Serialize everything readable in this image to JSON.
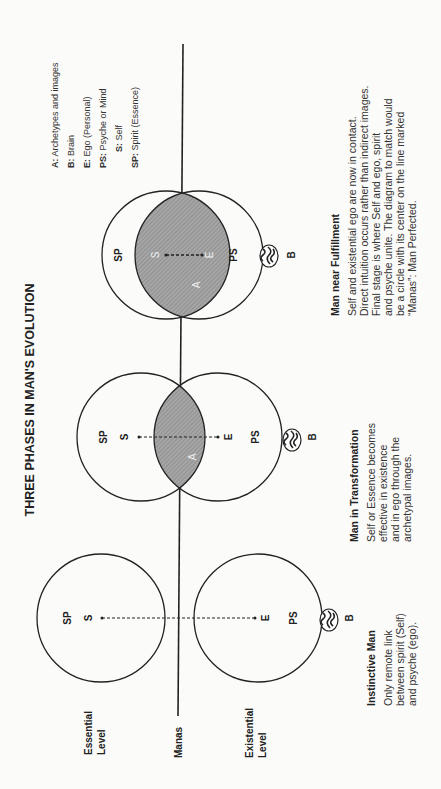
{
  "title": "THREE PHASES IN MAN'S EVOLUTION",
  "levels": {
    "essential": [
      "Essential",
      "Level"
    ],
    "manas": "Manas",
    "existential": [
      "Existential",
      "Level"
    ]
  },
  "legend": [
    {
      "key": "A:",
      "text": " Archetypes and images"
    },
    {
      "key": "B:",
      "text": " Brain"
    },
    {
      "key": "E:",
      "text": " Ego (Personal)"
    },
    {
      "key": "PS:",
      "text": " Psyche or Mind"
    },
    {
      "key": "S:",
      "text": " Self"
    },
    {
      "key": "SP:",
      "text": " Spirit (Essence)"
    }
  ],
  "phases": [
    {
      "name": "Instinctive Man",
      "description": [
        "Only remote link",
        "between spirit (Self)",
        "and psyche (ego)."
      ],
      "labels": {
        "sp": "SP",
        "s": "S",
        "e": "E",
        "ps": "PS",
        "b": "B"
      }
    },
    {
      "name": "Man in Transformation",
      "description": [
        "Self or Essence becomes",
        "effective in existence",
        "and in ego through the",
        "archetypal images."
      ],
      "labels": {
        "sp": "SP",
        "s": "S",
        "e": "E",
        "ps": "PS",
        "b": "B",
        "a": "A"
      }
    },
    {
      "name": "Man near Fulfillment",
      "description": [
        "Self and existential ego  are now in contact.",
        "Direct intuition occurs rather than indirect images.",
        "Final stage is where Self and ego, spirit",
        "and psyche unite.  The diagram to match would",
        "be a circle with its center on the line marked",
        "“Manas”: Man Perfected."
      ],
      "labels": {
        "sp": "SP",
        "s": "S",
        "e": "E",
        "ps": "PS",
        "b": "B",
        "a": "A"
      }
    }
  ],
  "colors": {
    "ink": "#222222",
    "lens": "#9a9a9a",
    "paper": "#fbfbf9"
  }
}
